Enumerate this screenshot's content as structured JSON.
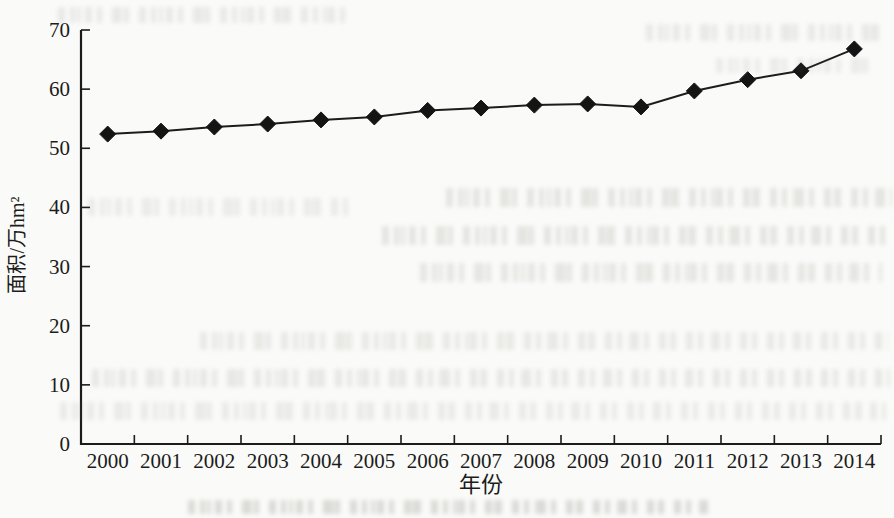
{
  "figure": {
    "kind": "scanned book page with line chart"
  },
  "chart_data": {
    "type": "line",
    "title": "",
    "xlabel": "年份",
    "ylabel": "面积/万hm²",
    "categories": [
      "2000",
      "2001",
      "2002",
      "2003",
      "2004",
      "2005",
      "2006",
      "2007",
      "2008",
      "2009",
      "2010",
      "2011",
      "2012",
      "2013",
      "2014"
    ],
    "values": [
      52.4,
      52.9,
      53.6,
      54.1,
      54.8,
      55.3,
      56.4,
      56.8,
      57.3,
      57.5,
      57.0,
      59.7,
      61.6,
      63.1,
      66.8
    ],
    "ylim": [
      0,
      70
    ],
    "yticks": [
      0,
      10,
      20,
      30,
      40,
      50,
      60,
      70
    ],
    "grid": false,
    "legend": "none",
    "marker": "diamond",
    "colors": {
      "line": "#1c1c1c",
      "marker": "#141414",
      "text": "#1c1c1c",
      "paper": "#fafaf8"
    }
  }
}
